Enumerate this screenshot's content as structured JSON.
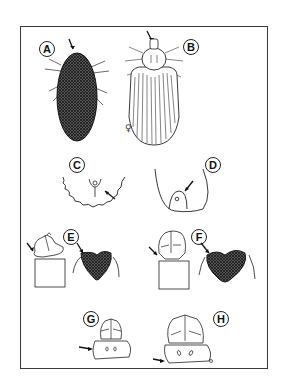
{
  "figure": {
    "frame_color": "#3a3a3a",
    "ink_color": "#222222",
    "panels": [
      {
        "id": "A",
        "label": "A",
        "description": "tick dorsal view, dark hatched body, arrow pointing to anterior"
      },
      {
        "id": "B",
        "label": "B",
        "description": "tick dorsal view, striated body with pale scutum, arrow pointing to capitulum",
        "symbol": "♀"
      },
      {
        "id": "C",
        "label": "C",
        "description": "posterior margin with festoons, arrow pointing to anal region"
      },
      {
        "id": "D",
        "label": "D",
        "description": "posterior margin without festoons, arrow pointing to anal plate"
      },
      {
        "id": "E",
        "label": "E",
        "description": "capitulum and dark scutum, arrows"
      },
      {
        "id": "F",
        "label": "F",
        "description": "capitulum and dark heart-shaped scutum, arrows"
      },
      {
        "id": "G",
        "label": "G",
        "description": "basis capituli ventral, arrow to lateral margin"
      },
      {
        "id": "H",
        "label": "H",
        "description": "basis capituli ventral, arrow to lateral margin"
      }
    ]
  }
}
